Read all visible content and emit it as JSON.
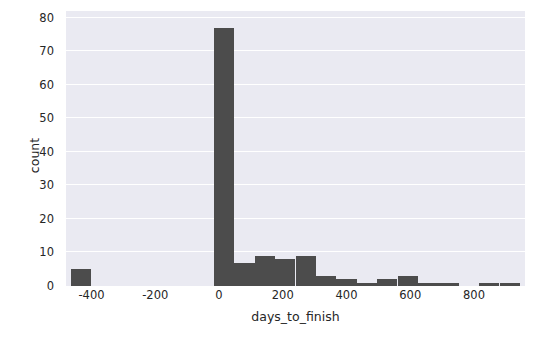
{
  "chart_data": {
    "type": "bar",
    "subtype": "histogram",
    "title": "",
    "xlabel": "days_to_finish",
    "ylabel": "count",
    "xlim": [
      -480,
      960
    ],
    "ylim": [
      0,
      82
    ],
    "grid": true,
    "grid_axis": "y",
    "legend": null,
    "bar_color": "#4c4c4c",
    "plot_background": "#eaeaf2",
    "figure_background": "#ffffff",
    "gridline_color": "#ffffff",
    "x_ticks": [
      -400,
      -200,
      0,
      200,
      400,
      600,
      800
    ],
    "x_tick_labels": [
      "-400",
      "-200",
      "0",
      "200",
      "400",
      "600",
      "800"
    ],
    "y_ticks": [
      0,
      10,
      20,
      30,
      40,
      50,
      60,
      70,
      80
    ],
    "y_tick_labels": [
      "0",
      "10",
      "20",
      "30",
      "40",
      "50",
      "60",
      "70",
      "80"
    ],
    "bin_width": 64,
    "bins": [
      {
        "x0": -464,
        "x1": -400,
        "count": 5
      },
      {
        "x0": -400,
        "x1": -336,
        "count": 0
      },
      {
        "x0": -336,
        "x1": -272,
        "count": 0
      },
      {
        "x0": -272,
        "x1": -208,
        "count": 0
      },
      {
        "x0": -208,
        "x1": -144,
        "count": 0
      },
      {
        "x0": -144,
        "x1": -80,
        "count": 0
      },
      {
        "x0": -80,
        "x1": -16,
        "count": 0
      },
      {
        "x0": -16,
        "x1": 48,
        "count": 77
      },
      {
        "x0": 48,
        "x1": 112,
        "count": 7
      },
      {
        "x0": 112,
        "x1": 176,
        "count": 9
      },
      {
        "x0": 176,
        "x1": 240,
        "count": 8
      },
      {
        "x0": 240,
        "x1": 304,
        "count": 9
      },
      {
        "x0": 304,
        "x1": 368,
        "count": 3
      },
      {
        "x0": 368,
        "x1": 432,
        "count": 2
      },
      {
        "x0": 432,
        "x1": 496,
        "count": 1
      },
      {
        "x0": 496,
        "x1": 560,
        "count": 2
      },
      {
        "x0": 560,
        "x1": 624,
        "count": 3
      },
      {
        "x0": 624,
        "x1": 688,
        "count": 1
      },
      {
        "x0": 688,
        "x1": 752,
        "count": 1
      },
      {
        "x0": 752,
        "x1": 816,
        "count": 0
      },
      {
        "x0": 816,
        "x1": 880,
        "count": 1
      },
      {
        "x0": 880,
        "x1": 944,
        "count": 1
      }
    ]
  }
}
